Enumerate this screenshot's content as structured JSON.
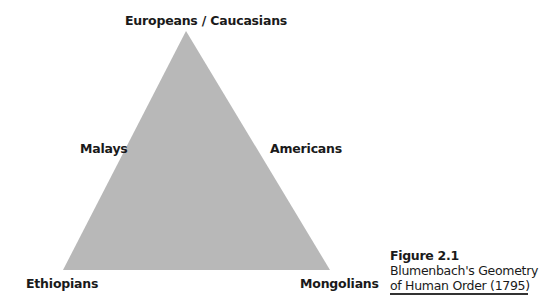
{
  "diagram": {
    "type": "triangle",
    "fill_color": "#b8b8b8",
    "vertices": {
      "top": "Europeans / Caucasians",
      "bottom_left": "Ethiopians",
      "bottom_right": "Mongolians"
    },
    "midpoints": {
      "left": "Malays",
      "right": "Americans"
    }
  },
  "caption": {
    "title": "Figure 2.1",
    "line1": "Blumenbach's Geometry",
    "line2": "of Human Order (1795)"
  }
}
